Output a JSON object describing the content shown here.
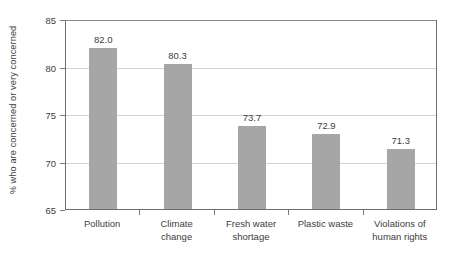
{
  "chart_data": {
    "type": "bar",
    "title": "",
    "xlabel": "",
    "ylabel": "% who are concerned or very concerned",
    "ylim": [
      65,
      85
    ],
    "ytick_labels": [
      "65",
      "70",
      "75",
      "80",
      "85"
    ],
    "ytick_values": [
      65,
      70,
      75,
      80,
      85
    ],
    "grid": true,
    "legend": "none",
    "bar_color": "#a6a6a6",
    "categories": [
      "Pollution",
      "Climate change",
      "Fresh water shortage",
      "Plastic waste",
      "Violations of human rights"
    ],
    "category_label_lines": [
      [
        "Pollution"
      ],
      [
        "Climate",
        "change"
      ],
      [
        "Fresh water",
        "shortage"
      ],
      [
        "Plastic waste"
      ],
      [
        "Violations of",
        "human rights"
      ]
    ],
    "values": [
      82.0,
      80.3,
      73.7,
      72.9,
      71.3
    ],
    "value_labels": [
      "82.0",
      "80.3",
      "73.7",
      "72.9",
      "71.3"
    ]
  }
}
